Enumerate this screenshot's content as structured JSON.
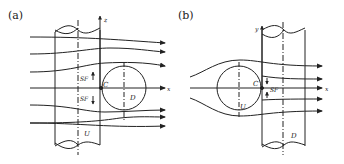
{
  "panels": [
    {
      "id": "a",
      "label": "(a)",
      "axis_vertical": "z",
      "axis_horizontal": "x",
      "point": "C",
      "upstream_cylinder": "U",
      "downstream_cylinder": "D",
      "force_upper": "SF",
      "force_lower": "SF"
    },
    {
      "id": "b",
      "label": "(b)",
      "axis_vertical": "y",
      "axis_horizontal": "x",
      "point": "C",
      "upstream_cylinder": "U",
      "downstream_cylinder": "D",
      "force": "SF"
    }
  ],
  "colors": {
    "line": "#222222",
    "background": "#ffffff"
  }
}
